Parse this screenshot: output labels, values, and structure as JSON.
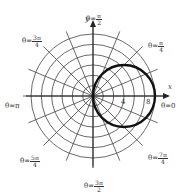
{
  "diagram": {
    "type": "polar-graph",
    "curve": "r = 8cos(theta) (estimated from pixel measurements; circle through origin, diameter 8 along positive x-axis)",
    "center_px": [
      93,
      96
    ],
    "px_per_unit": 7.75,
    "ring_count": 6,
    "spoke_count": 16,
    "curve_color": "#111111",
    "grid_color": "#444444"
  },
  "axes": {
    "x_label": "x",
    "y_label": "y",
    "ticks": [
      {
        "value": "4",
        "units": 4
      },
      {
        "value": "8",
        "units": 8
      }
    ]
  },
  "angle_labels": [
    {
      "id": "theta-0",
      "prefix": "θ=",
      "text": "0"
    },
    {
      "id": "theta-pi-4",
      "prefix": "θ=",
      "num": "π",
      "den": "4"
    },
    {
      "id": "theta-pi-2",
      "prefix": "θ=",
      "num": "π",
      "den": "2"
    },
    {
      "id": "theta-3pi-4",
      "prefix": "θ=",
      "num": "3π",
      "den": "4"
    },
    {
      "id": "theta-pi",
      "prefix": "θ=",
      "text": "π"
    },
    {
      "id": "theta-5pi-4",
      "prefix": "θ=",
      "num": "5π",
      "den": "4"
    },
    {
      "id": "theta-3pi-2",
      "prefix": "θ=",
      "num": "3π",
      "den": "2"
    },
    {
      "id": "theta-7pi-4",
      "prefix": "θ=",
      "num": "7π",
      "den": "4"
    }
  ]
}
